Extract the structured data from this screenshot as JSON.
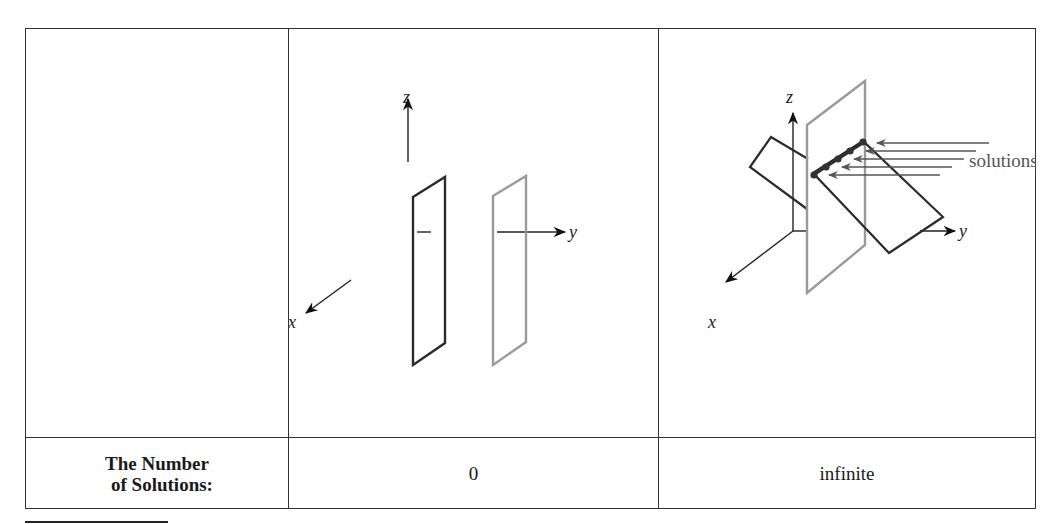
{
  "table": {
    "row_label": {
      "line1": "The Number",
      "line2": "of Solutions:"
    },
    "columns": [
      {
        "value": "0",
        "figure": {
          "description": "Two parallel planes, no intersection",
          "axes": {
            "x": "x",
            "y": "y",
            "z": "z"
          }
        }
      },
      {
        "value": "infinite",
        "figure": {
          "description": "Two planes intersecting in a line",
          "axes": {
            "x": "x",
            "y": "y",
            "z": "z"
          },
          "annotation": "solutions"
        }
      }
    ]
  },
  "colors": {
    "border": "#333333",
    "plane_dark": "#2b2b2b",
    "plane_light": "#9a9a9a",
    "arrow_gray": "#555555"
  }
}
